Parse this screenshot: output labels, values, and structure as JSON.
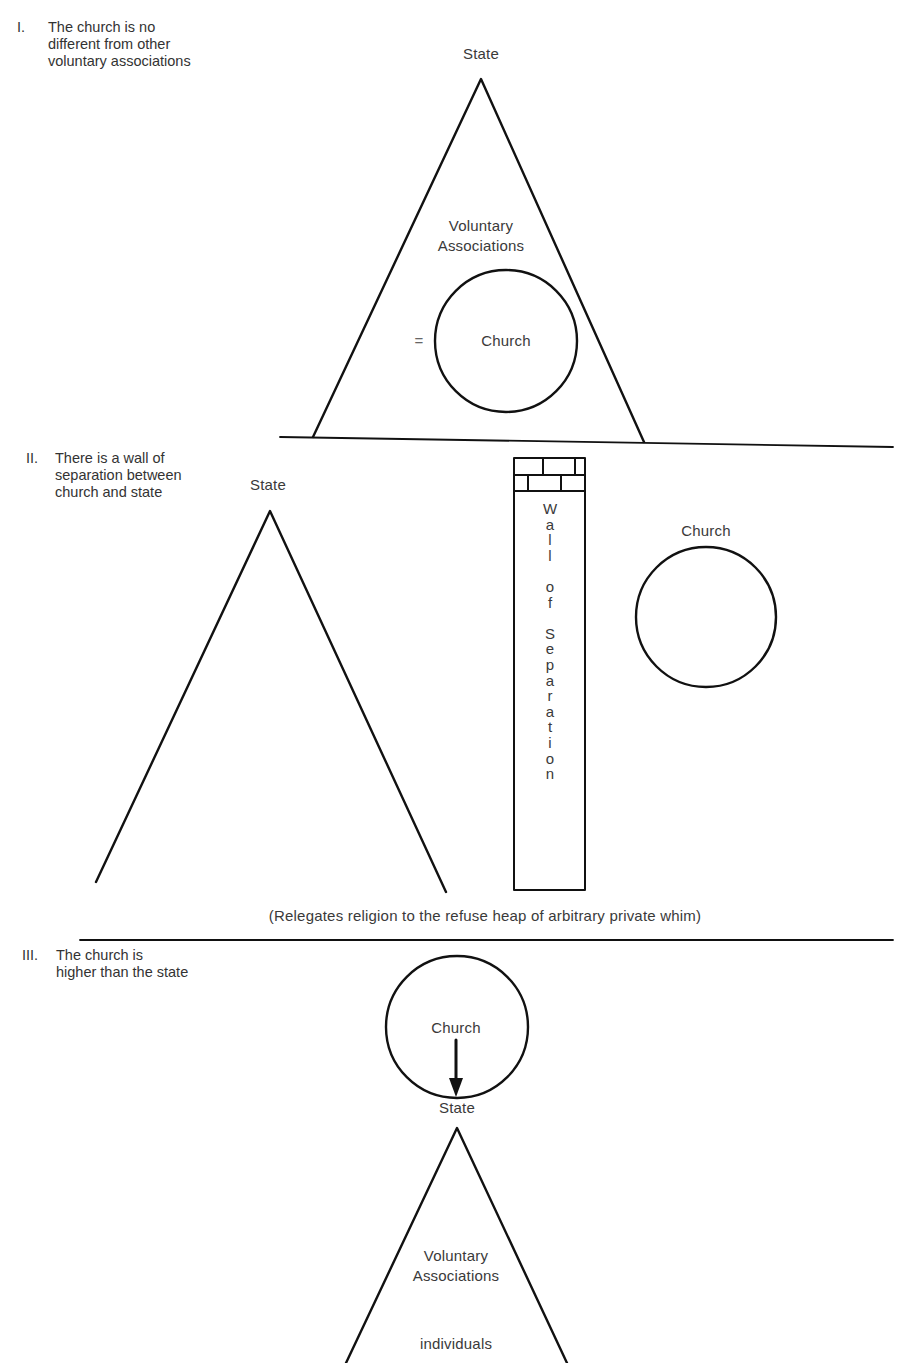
{
  "figure": {
    "panels": [
      {
        "numeral": "I.",
        "caption_lines": [
          "The church is no",
          "different from other",
          "voluntary associations"
        ],
        "labels": {
          "apex": "State",
          "middle_line1": "Voluntary",
          "middle_line2": "Associations",
          "equals": "=",
          "circle": "Church"
        }
      },
      {
        "numeral": "II.",
        "caption_lines": [
          "There is a wall of",
          "separation between",
          "church and state"
        ],
        "labels": {
          "apex": "State",
          "circle": "Church",
          "wall_text": "Wall of Separation",
          "wall_letters": [
            "W",
            "a",
            "l",
            "l",
            "",
            "o",
            "f",
            "",
            "S",
            "e",
            "p",
            "a",
            "r",
            "a",
            "t",
            "i",
            "o",
            "n"
          ]
        },
        "note": "(Relegates religion to the refuse heap of arbitrary private whim)"
      },
      {
        "numeral": "III.",
        "caption_lines": [
          "The church is",
          "higher than the state"
        ],
        "labels": {
          "circle": "Church",
          "apex": "State",
          "middle_line1": "Voluntary",
          "middle_line2": "Associations",
          "base": "individuals"
        }
      }
    ]
  },
  "colors": {
    "ink": "#111111",
    "text": "#3a3a3a",
    "paper": "#ffffff"
  }
}
